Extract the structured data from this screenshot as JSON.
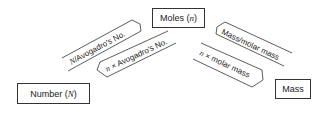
{
  "diagram": {
    "nodes": {
      "moles": {
        "label": "Moles (",
        "var": "n",
        "close": ")"
      },
      "number": {
        "label": "Number (",
        "var": "N",
        "close": ")"
      },
      "mass": {
        "label": "Mass"
      }
    },
    "edges": {
      "number_to_moles": {
        "prefix": "N",
        "text": "/Avogadro's No.",
        "from": "Number",
        "to": "Moles"
      },
      "moles_to_number": {
        "prefix": "n",
        "text": " × Avogadro's No.",
        "from": "Moles",
        "to": "Number"
      },
      "mass_to_moles": {
        "text": "Mass/molar mass",
        "from": "Mass",
        "to": "Moles"
      },
      "moles_to_mass": {
        "prefix": "n",
        "text": " × molar mass",
        "from": "Moles",
        "to": "Mass"
      }
    }
  }
}
